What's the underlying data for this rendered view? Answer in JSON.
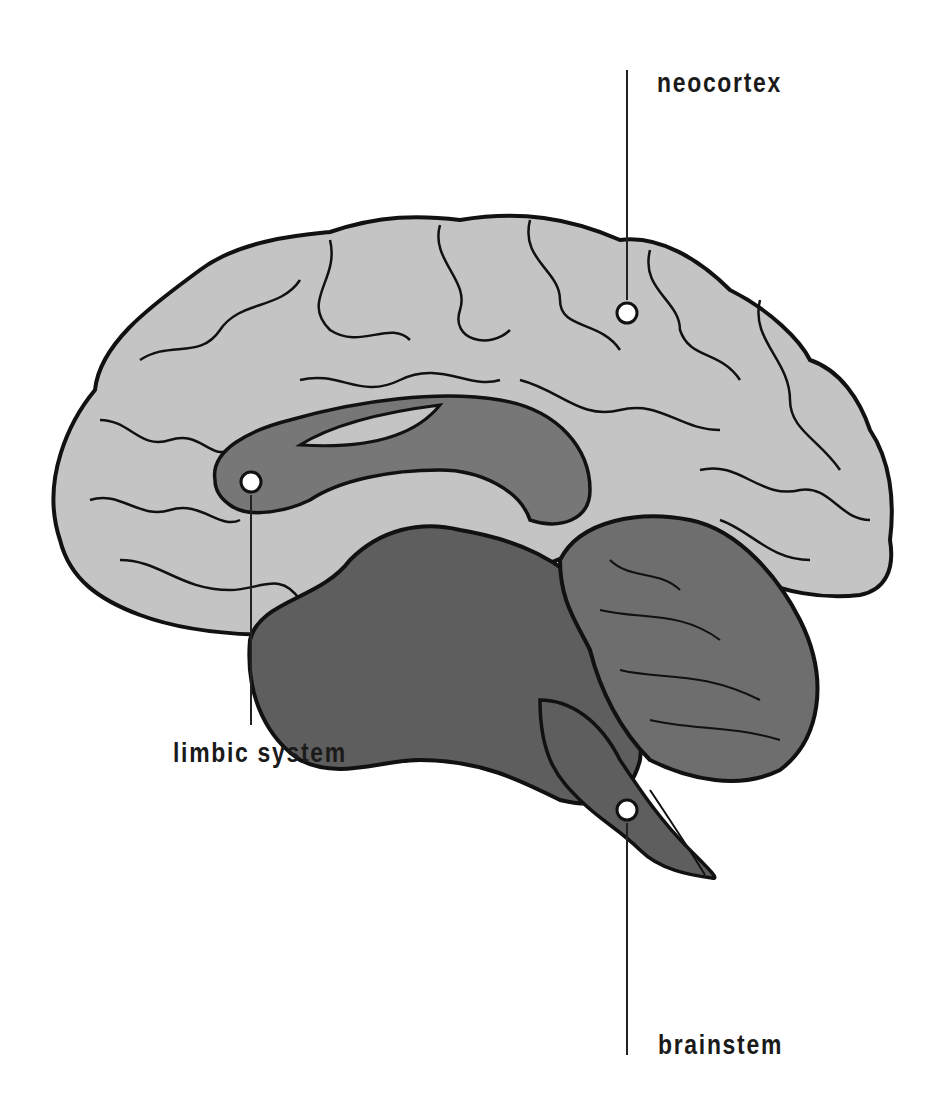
{
  "diagram": {
    "colors": {
      "background": "#ffffff",
      "neocortex_fill": "#c4c4c4",
      "limbic_fill": "#777777",
      "deep_fill": "#5e5e5e",
      "outline": "#111111",
      "leader_line": "#222222",
      "marker": "#ffffff"
    },
    "labels": [
      {
        "id": "neocortex",
        "text": "neocortex",
        "x": 657,
        "y": 92
      },
      {
        "id": "limbic",
        "text": "limbic system",
        "x": 173,
        "y": 732
      },
      {
        "id": "brainstem",
        "text": "brainstem",
        "x": 658,
        "y": 1032
      }
    ],
    "markers": [
      {
        "id": "neocortex",
        "cx": 627,
        "cy": 313,
        "line": [
          627,
          70,
          627,
          300
        ]
      },
      {
        "id": "limbic",
        "cx": 251,
        "cy": 482,
        "line": [
          251,
          495,
          251,
          725
        ]
      },
      {
        "id": "brainstem",
        "cx": 627,
        "cy": 810,
        "line": [
          627,
          823,
          627,
          1055
        ]
      }
    ]
  }
}
